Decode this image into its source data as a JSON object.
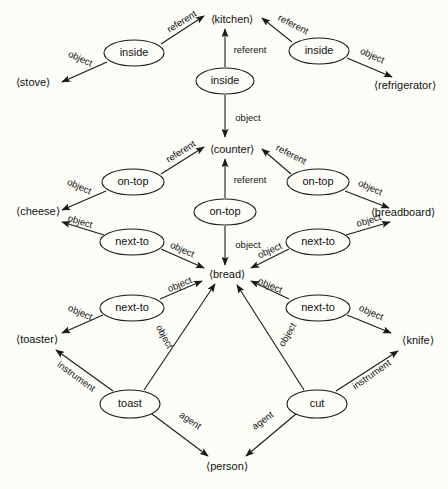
{
  "diagram": {
    "type": "semantic-network",
    "title": "",
    "brackets": {
      "open": "⟨",
      "close": "⟩"
    },
    "colors": {
      "background": "#fdfdf7",
      "stroke": "#1a1a1a",
      "text": "#111111"
    },
    "concept_nodes": [
      {
        "id": "inside-left",
        "label": "inside",
        "cx": 134,
        "cy": 53,
        "rx": 30,
        "ry": 13
      },
      {
        "id": "inside-center",
        "label": "inside",
        "cx": 225,
        "cy": 81,
        "rx": 29,
        "ry": 13
      },
      {
        "id": "inside-right",
        "label": "inside",
        "cx": 319,
        "cy": 51,
        "rx": 30,
        "ry": 13
      },
      {
        "id": "ontop-left",
        "label": "on-top",
        "cx": 133,
        "cy": 182,
        "rx": 31,
        "ry": 13
      },
      {
        "id": "ontop-center",
        "label": "on-top",
        "cx": 225,
        "cy": 212,
        "rx": 31,
        "ry": 13
      },
      {
        "id": "ontop-right",
        "label": "on-top",
        "cx": 318,
        "cy": 182,
        "rx": 31,
        "ry": 13
      },
      {
        "id": "nextto-upleft",
        "label": "next-to",
        "cx": 132,
        "cy": 242,
        "rx": 32,
        "ry": 13
      },
      {
        "id": "nextto-upright",
        "label": "next-to",
        "cx": 318,
        "cy": 242,
        "rx": 32,
        "ry": 13
      },
      {
        "id": "nextto-lowleft",
        "label": "next-to",
        "cx": 132,
        "cy": 308,
        "rx": 32,
        "ry": 13
      },
      {
        "id": "nextto-lowright",
        "label": "next-to",
        "cx": 318,
        "cy": 308,
        "rx": 32,
        "ry": 13
      },
      {
        "id": "toast",
        "label": "toast",
        "cx": 130,
        "cy": 404,
        "rx": 30,
        "ry": 14
      },
      {
        "id": "cut",
        "label": "cut",
        "cx": 317,
        "cy": 404,
        "rx": 30,
        "ry": 14
      }
    ],
    "entity_nodes": [
      {
        "id": "kitchen",
        "label": "⟨kitchen⟩",
        "x": 232,
        "y": 20
      },
      {
        "id": "stove",
        "label": "⟨stove⟩",
        "x": 33,
        "y": 83
      },
      {
        "id": "refrigerator",
        "label": "⟨refrigerator⟩",
        "x": 405,
        "y": 86
      },
      {
        "id": "counter",
        "label": "⟨counter⟩",
        "x": 232,
        "y": 150
      },
      {
        "id": "cheese",
        "label": "⟨cheese⟩",
        "x": 38,
        "y": 212
      },
      {
        "id": "breadboard",
        "label": "⟨breadboard⟩",
        "x": 403,
        "y": 213
      },
      {
        "id": "bread",
        "label": "⟨bread⟩",
        "x": 227,
        "y": 275
      },
      {
        "id": "toaster",
        "label": "⟨toaster⟩",
        "x": 37,
        "y": 340
      },
      {
        "id": "knife",
        "label": "⟨knife⟩",
        "x": 418,
        "y": 341
      },
      {
        "id": "person",
        "label": "⟨person⟩",
        "x": 227,
        "y": 467
      }
    ],
    "edges": [
      {
        "id": "e1",
        "from": "inside-left",
        "to": "kitchen",
        "label": "referent",
        "x1": 161,
        "y1": 44,
        "x2": 204,
        "y2": 16,
        "lx": 182,
        "ly": 22,
        "rot": -32
      },
      {
        "id": "e2",
        "from": "inside-left",
        "to": "stove",
        "label": "object",
        "x1": 107,
        "y1": 62,
        "x2": 62,
        "y2": 82,
        "lx": 80,
        "ly": 59,
        "rot": 24
      },
      {
        "id": "e3",
        "from": "inside-center",
        "to": "kitchen",
        "label": "referent",
        "x1": 225,
        "y1": 67,
        "x2": 225,
        "y2": 29,
        "lx": 250,
        "ly": 50,
        "rot": 0
      },
      {
        "id": "e4",
        "from": "inside-center",
        "to": "counter",
        "label": "object",
        "x1": 225,
        "y1": 95,
        "x2": 225,
        "y2": 137,
        "lx": 248,
        "ly": 118,
        "rot": 0
      },
      {
        "id": "e5",
        "from": "inside-right",
        "to": "kitchen",
        "label": "referent",
        "x1": 292,
        "y1": 42,
        "x2": 262,
        "y2": 18,
        "lx": 293,
        "ly": 25,
        "rot": 27
      },
      {
        "id": "e6",
        "from": "inside-right",
        "to": "refrigerator",
        "label": "object",
        "x1": 347,
        "y1": 58,
        "x2": 392,
        "y2": 77,
        "lx": 372,
        "ly": 56,
        "rot": 24
      },
      {
        "id": "e7",
        "from": "ontop-left",
        "to": "counter",
        "label": "referent",
        "x1": 161,
        "y1": 174,
        "x2": 204,
        "y2": 147,
        "lx": 181,
        "ly": 152,
        "rot": -32
      },
      {
        "id": "e8",
        "from": "ontop-left",
        "to": "cheese",
        "label": "object",
        "x1": 106,
        "y1": 191,
        "x2": 62,
        "y2": 210,
        "lx": 79,
        "ly": 187,
        "rot": 24
      },
      {
        "id": "e9",
        "from": "ontop-center",
        "to": "counter",
        "label": "referent",
        "x1": 225,
        "y1": 198,
        "x2": 225,
        "y2": 159,
        "lx": 250,
        "ly": 180,
        "rot": 0
      },
      {
        "id": "e10",
        "from": "ontop-center",
        "to": "bread",
        "label": "object",
        "x1": 225,
        "y1": 226,
        "x2": 225,
        "y2": 265,
        "lx": 248,
        "ly": 245,
        "rot": 0
      },
      {
        "id": "e11",
        "from": "ontop-right",
        "to": "counter",
        "label": "referent",
        "x1": 291,
        "y1": 174,
        "x2": 262,
        "y2": 149,
        "lx": 291,
        "ly": 155,
        "rot": 27
      },
      {
        "id": "e12",
        "from": "ontop-right",
        "to": "breadboard",
        "label": "object",
        "x1": 345,
        "y1": 191,
        "x2": 389,
        "y2": 208,
        "lx": 370,
        "ly": 188,
        "rot": 24
      },
      {
        "id": "e13",
        "from": "nextto-upleft",
        "to": "cheese",
        "label": "object",
        "x1": 104,
        "y1": 235,
        "x2": 62,
        "y2": 222,
        "lx": 80,
        "ly": 222,
        "rot": 17
      },
      {
        "id": "e14",
        "from": "nextto-upleft",
        "to": "bread",
        "label": "object",
        "x1": 161,
        "y1": 249,
        "x2": 204,
        "y2": 268,
        "lx": 182,
        "ly": 250,
        "rot": 24
      },
      {
        "id": "e15",
        "from": "nextto-upright",
        "to": "breadboard",
        "label": "object",
        "x1": 346,
        "y1": 235,
        "x2": 390,
        "y2": 222,
        "lx": 369,
        "ly": 221,
        "rot": -17
      },
      {
        "id": "e16",
        "from": "nextto-upright",
        "to": "bread",
        "label": "object",
        "x1": 289,
        "y1": 249,
        "x2": 251,
        "y2": 268,
        "lx": 270,
        "ly": 251,
        "rot": -24
      },
      {
        "id": "e17",
        "from": "nextto-lowleft",
        "to": "toaster",
        "label": "object",
        "x1": 103,
        "y1": 315,
        "x2": 62,
        "y2": 333,
        "lx": 80,
        "ly": 313,
        "rot": 23
      },
      {
        "id": "e18",
        "from": "nextto-lowleft",
        "to": "bread",
        "label": "object",
        "x1": 160,
        "y1": 299,
        "x2": 202,
        "y2": 281,
        "lx": 180,
        "ly": 285,
        "rot": -23
      },
      {
        "id": "e19",
        "from": "nextto-lowright",
        "to": "knife",
        "label": "object",
        "x1": 347,
        "y1": 315,
        "x2": 391,
        "y2": 333,
        "lx": 371,
        "ly": 313,
        "rot": 23
      },
      {
        "id": "e20",
        "from": "nextto-lowright",
        "to": "bread",
        "label": "object",
        "x1": 289,
        "y1": 299,
        "x2": 251,
        "y2": 281,
        "lx": 270,
        "ly": 286,
        "rot": 23
      },
      {
        "id": "e21",
        "from": "toast",
        "to": "toaster",
        "label": "instrument",
        "x1": 113,
        "y1": 391,
        "x2": 56,
        "y2": 350,
        "lx": 76,
        "ly": 377,
        "rot": 36
      },
      {
        "id": "e22",
        "from": "toast",
        "to": "bread",
        "label": "object",
        "x1": 144,
        "y1": 390,
        "x2": 215,
        "y2": 284,
        "lx": 164,
        "ly": 337,
        "rot": 62
      },
      {
        "id": "e23",
        "from": "toast",
        "to": "person",
        "label": "agent",
        "x1": 152,
        "y1": 414,
        "x2": 208,
        "y2": 456,
        "lx": 190,
        "ly": 421,
        "rot": 35
      },
      {
        "id": "e24",
        "from": "cut",
        "to": "knife",
        "label": "instrument",
        "x1": 336,
        "y1": 391,
        "x2": 398,
        "y2": 351,
        "lx": 372,
        "ly": 375,
        "rot": -35
      },
      {
        "id": "e25",
        "from": "cut",
        "to": "bread",
        "label": "object",
        "x1": 304,
        "y1": 390,
        "x2": 237,
        "y2": 285,
        "lx": 288,
        "ly": 335,
        "rot": -60
      },
      {
        "id": "e26",
        "from": "cut",
        "to": "person",
        "label": "agent",
        "x1": 296,
        "y1": 414,
        "x2": 246,
        "y2": 456,
        "lx": 263,
        "ly": 421,
        "rot": -36
      }
    ]
  }
}
